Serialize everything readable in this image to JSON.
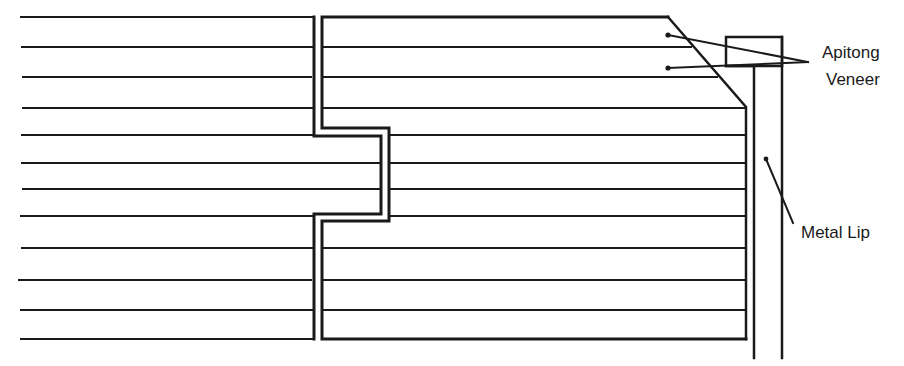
{
  "diagram": {
    "type": "cross-section",
    "colors": {
      "line": "#1a1a1a",
      "background": "#ffffff"
    },
    "labels": {
      "veneer_line1": "Apitong",
      "veneer_line2": "Veneer",
      "metal_lip": "Metal Lip"
    },
    "ply_lines_y": [
      17,
      47,
      77,
      108,
      135,
      163,
      189,
      216,
      248,
      280,
      310,
      339
    ],
    "left_panel": {
      "x_start": 20,
      "joint_x": 314,
      "tongue_x": 381,
      "tongue_top": 136,
      "tongue_bottom": 214
    },
    "right_panel": {
      "joint_x": 322,
      "groove_x": 389,
      "groove_top": 128,
      "groove_bottom": 221,
      "top_corner_x": 668,
      "bevel_end": [
        746,
        108
      ],
      "edge_x": 746
    },
    "metal_lip": {
      "inner_x": 754,
      "outer_x": 782,
      "bottom_y": 358
    },
    "veneer_block": {
      "x": 726,
      "y": 37,
      "width": 56,
      "height": 29
    }
  }
}
